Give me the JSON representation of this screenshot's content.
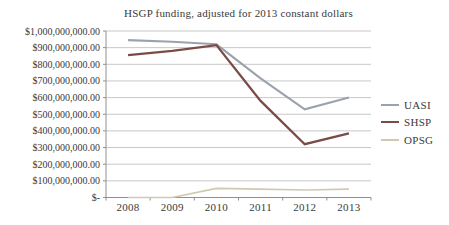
{
  "chart_data": {
    "type": "line",
    "title": "HSGP funding, adjusted for 2013 constant dollars",
    "categories": [
      "2008",
      "2009",
      "2010",
      "2011",
      "2012",
      "2013"
    ],
    "series": [
      {
        "name": "UASI",
        "color": "#9CA2AD",
        "line_width": 2.1,
        "values": [
          945000000,
          935000000,
          920000000,
          715000000,
          530000000,
          600000000
        ]
      },
      {
        "name": "SHSP",
        "color": "#7A4B47",
        "line_width": 2.3,
        "values": [
          855000000,
          880000000,
          915000000,
          580000000,
          320000000,
          385000000
        ]
      },
      {
        "name": "OPSG",
        "color": "#D0C9B2",
        "line_width": 1.7,
        "values": [
          0,
          0,
          55000000,
          50000000,
          45000000,
          50000000
        ]
      }
    ],
    "xlabel": "",
    "ylabel": "",
    "ylim": [
      0,
      1000000000
    ],
    "y_tick_interval": 100000000,
    "y_tick_labels": [
      "$1,000,000,000.00",
      "$900,000,000.00",
      "$800,000,000.00",
      "$700,000,000.00",
      "$600,000,000.00",
      "$500,000,000.00",
      "$400,000,000.00",
      "$300,000,000.00",
      "$200,000,000.00",
      "$100,000,000.00",
      "$-"
    ],
    "grid": true,
    "legend_position": "right"
  },
  "style_colors": {
    "grid": "#C8C8C8",
    "axis": "#8F8F8F",
    "text": "#3A3A3A",
    "background": "#FFFFFF"
  }
}
